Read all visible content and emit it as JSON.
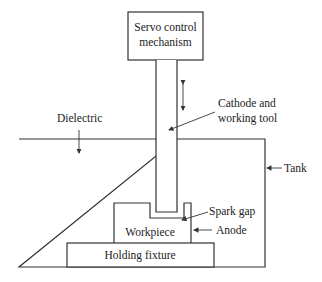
{
  "diagram": {
    "components": {
      "servo": {
        "line1": "Servo control",
        "line2": "mechanism"
      },
      "tank": "Tank",
      "dielectric": "Dielectric",
      "cathode": {
        "line1": "Cathode and",
        "line2": "working tool"
      },
      "spark_gap": "Spark gap",
      "workpiece": "Workpiece",
      "anode": "Anode",
      "fixture": "Holding fixture"
    },
    "colors": {
      "line": "#333333",
      "text": "#222222",
      "background": "#ffffff"
    }
  }
}
